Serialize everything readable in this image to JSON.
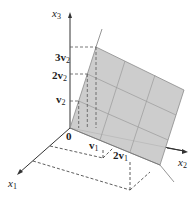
{
  "diagram": {
    "type": "3d-plane-span",
    "axes": {
      "x1": {
        "label": "x",
        "sub": "1"
      },
      "x2": {
        "label": "x",
        "sub": "2"
      },
      "x3": {
        "label": "x",
        "sub": "3"
      }
    },
    "origin_label": "0",
    "vector_labels": {
      "v1": {
        "coef": "",
        "name": "v",
        "sub": "1"
      },
      "two_v1": {
        "coef": "2",
        "name": "v",
        "sub": "1"
      },
      "v2": {
        "coef": "",
        "name": "v",
        "sub": "2"
      },
      "two_v2": {
        "coef": "2",
        "name": "v",
        "sub": "2"
      },
      "three_v2": {
        "coef": "3",
        "name": "v",
        "sub": "2"
      }
    },
    "colors": {
      "plane_fill": "#c9c9c9",
      "plane_edge": "#8a8a8a",
      "grid": "#9a9a9a",
      "axis": "#333333",
      "dash": "#333333"
    }
  }
}
